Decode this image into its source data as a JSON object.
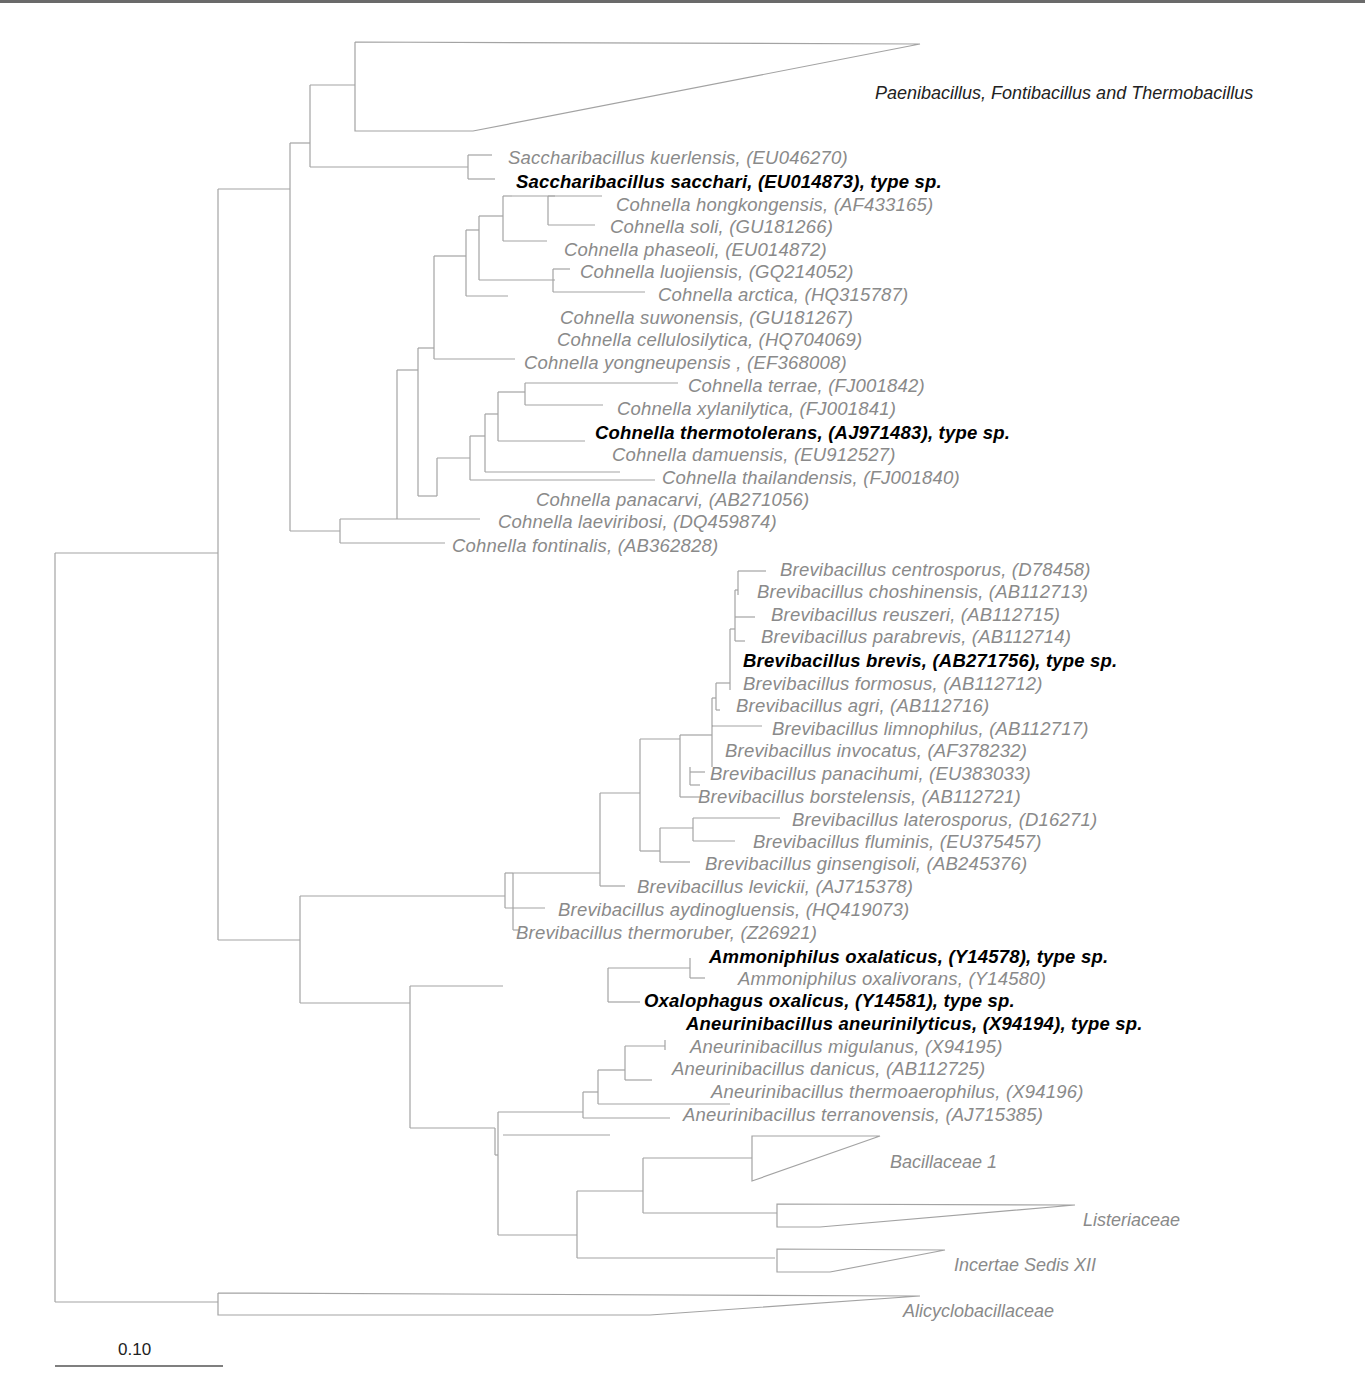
{
  "figure": {
    "type": "phylogenetic-tree",
    "scale_bar": {
      "label": "0.10"
    }
  },
  "collapsed_clades": [
    {
      "label": "Paenibacillus, Fontibacillus and Thermobacillus"
    },
    {
      "label": "Bacillaceae 1"
    },
    {
      "label": "Listeriaceae"
    },
    {
      "label": "Incertae Sedis XII"
    },
    {
      "label": "Alicyclobacillaceae"
    }
  ],
  "taxa": [
    {
      "name": "Saccharibacillus kuerlensis, (EU046270)",
      "type_species": false
    },
    {
      "name": "Saccharibacillus sacchari, (EU014873), type sp.",
      "type_species": true
    },
    {
      "name": "Cohnella hongkongensis, (AF433165)",
      "type_species": false
    },
    {
      "name": "Cohnella soli, (GU181266)",
      "type_species": false
    },
    {
      "name": "Cohnella phaseoli, (EU014872)",
      "type_species": false
    },
    {
      "name": "Cohnella luojiensis, (GQ214052)",
      "type_species": false
    },
    {
      "name": "Cohnella arctica, (HQ315787)",
      "type_species": false
    },
    {
      "name": "Cohnella suwonensis, (GU181267)",
      "type_species": false
    },
    {
      "name": "Cohnella cellulosilytica, (HQ704069)",
      "type_species": false
    },
    {
      "name": "Cohnella yongneupensis , (EF368008)",
      "type_species": false
    },
    {
      "name": "Cohnella terrae, (FJ001842)",
      "type_species": false
    },
    {
      "name": "Cohnella xylanilytica, (FJ001841)",
      "type_species": false
    },
    {
      "name": "Cohnella thermotolerans, (AJ971483), type sp.",
      "type_species": true
    },
    {
      "name": "Cohnella damuensis, (EU912527)",
      "type_species": false
    },
    {
      "name": "Cohnella thailandensis, (FJ001840)",
      "type_species": false
    },
    {
      "name": "Cohnella panacarvi, (AB271056)",
      "type_species": false
    },
    {
      "name": "Cohnella laeviribosi, (DQ459874)",
      "type_species": false
    },
    {
      "name": "Cohnella fontinalis, (AB362828)",
      "type_species": false
    },
    {
      "name": "Brevibacillus centrosporus, (D78458)",
      "type_species": false
    },
    {
      "name": "Brevibacillus choshinensis, (AB112713)",
      "type_species": false
    },
    {
      "name": "Brevibacillus reuszeri, (AB112715)",
      "type_species": false
    },
    {
      "name": "Brevibacillus parabrevis, (AB112714)",
      "type_species": false
    },
    {
      "name": "Brevibacillus brevis, (AB271756), type sp.",
      "type_species": true
    },
    {
      "name": "Brevibacillus formosus, (AB112712)",
      "type_species": false
    },
    {
      "name": "Brevibacillus agri, (AB112716)",
      "type_species": false
    },
    {
      "name": "Brevibacillus limnophilus, (AB112717)",
      "type_species": false
    },
    {
      "name": "Brevibacillus invocatus, (AF378232)",
      "type_species": false
    },
    {
      "name": "Brevibacillus panacihumi, (EU383033)",
      "type_species": false
    },
    {
      "name": "Brevibacillus borstelensis, (AB112721)",
      "type_species": false
    },
    {
      "name": "Brevibacillus laterosporus, (D16271)",
      "type_species": false
    },
    {
      "name": "Brevibacillus fluminis, (EU375457)",
      "type_species": false
    },
    {
      "name": "Brevibacillus ginsengisoli, (AB245376)",
      "type_species": false
    },
    {
      "name": "Brevibacillus levickii, (AJ715378)",
      "type_species": false
    },
    {
      "name": "Brevibacillus aydinogluensis, (HQ419073)",
      "type_species": false
    },
    {
      "name": "Brevibacillus thermoruber, (Z26921)",
      "type_species": false
    },
    {
      "name": "Ammoniphilus oxalaticus, (Y14578), type sp.",
      "type_species": true
    },
    {
      "name": "Ammoniphilus oxalivorans, (Y14580)",
      "type_species": false
    },
    {
      "name": "Oxalophagus oxalicus, (Y14581), type sp.",
      "type_species": true
    },
    {
      "name": "Aneurinibacillus aneurinilyticus, (X94194), type sp.",
      "type_species": true
    },
    {
      "name": "Aneurinibacillus migulanus, (X94195)",
      "type_species": false
    },
    {
      "name": "Aneurinibacillus danicus, (AB112725)",
      "type_species": false
    },
    {
      "name": "Aneurinibacillus thermoaerophilus, (X94196)",
      "type_species": false
    },
    {
      "name": "Aneurinibacillus terranovensis, (AJ715385)",
      "type_species": false
    }
  ],
  "colors": {
    "branch": "#9a9a9a",
    "label_default": "#8a8a8a",
    "label_type_species": "#000000"
  }
}
